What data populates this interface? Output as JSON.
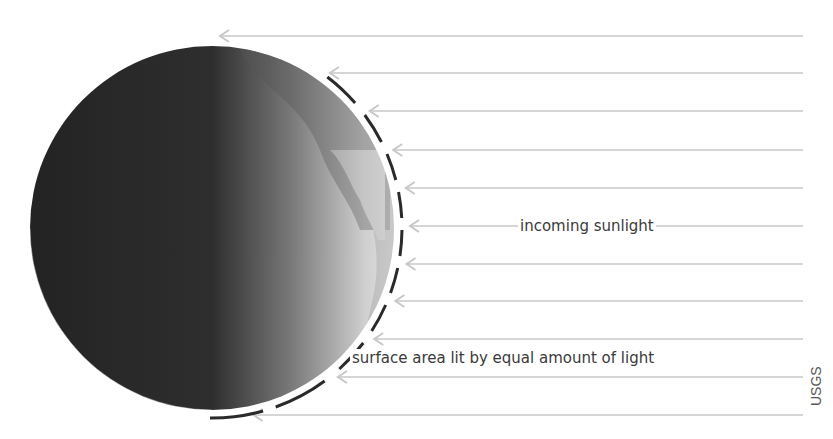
{
  "diagram": {
    "labels": {
      "incoming": "incoming sunlight",
      "surface": "surface area lit by equal amount of light"
    },
    "credit": "USGS",
    "globe": {
      "cx": 212,
      "cy": 228,
      "r": 182,
      "dark_color": "#262626",
      "lit_color": "#d8d8d8"
    },
    "arc": {
      "r": 190,
      "color": "#2a2a2a"
    },
    "arrows": {
      "count": 11,
      "rows_y": [
        36,
        73,
        111,
        150,
        188,
        226,
        264,
        301,
        339,
        377,
        415
      ],
      "end_x": 803,
      "color": "#c8c8c8"
    }
  }
}
